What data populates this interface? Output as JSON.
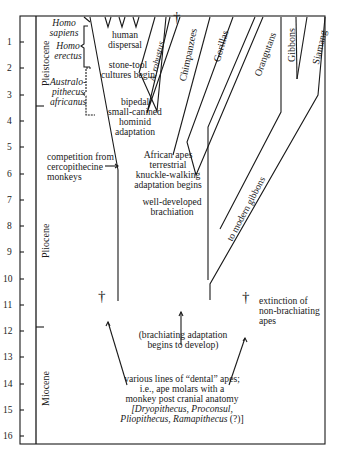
{
  "axis": {
    "ticks": [
      "1",
      "2",
      "3",
      "4",
      "5",
      "6",
      "7",
      "8",
      "9",
      "10",
      "11",
      "12",
      "13",
      "14",
      "15",
      "16"
    ],
    "unit": "million years ago"
  },
  "epochs": {
    "pleistocene": "Pleistocene",
    "pliocene": "Pliocene",
    "miocene": "Miocene"
  },
  "hominids": {
    "homo_sapiens": [
      "Homo",
      "sapiens"
    ],
    "homo_erectus": [
      "Homo",
      "erectus"
    ],
    "australopithecus": [
      "Australo-",
      "pithecus",
      "africanus"
    ],
    "a_robustus": "A. robustus"
  },
  "lineages": {
    "chimpanzees": "Chimpanzees",
    "gorillas": "Gorillas",
    "orangutans": "Orangutans",
    "gibbons": "Gibbons",
    "siamang": "Siamang",
    "to_modern_gibbons": "to modern gibbons"
  },
  "annotations": {
    "human_dispersal": [
      "human",
      "dispersal"
    ],
    "stone_tool": [
      "stone-tool",
      "cultures begin"
    ],
    "bipedal": [
      "bipedal",
      "small-canined",
      "hominid",
      "adaptation"
    ],
    "competition": [
      "competition from",
      "cercopithecine",
      "monkeys"
    ],
    "african_apes": [
      "African apes",
      "terrestrial",
      "knuckle-walking",
      "adaptation begins"
    ],
    "brachiation": [
      "well-developed",
      "brachiation"
    ],
    "extinction": [
      "extinction of",
      "non-brachiating",
      "apes"
    ],
    "brachiating_begins": [
      "(brachiating adaptation",
      "begins to develop)"
    ],
    "dental_apes": [
      "various lines of “dental” apes;",
      "i.e., ape molars with a",
      "monkey post cranial anatomy"
    ],
    "dental_genera_1": "[Dryopithecus, Proconsul,",
    "dental_genera_2": "Pliopithecus, Ramapithecus",
    "dental_genera_q": " (?)]"
  },
  "symbols": {
    "extinction_cross": "†"
  }
}
